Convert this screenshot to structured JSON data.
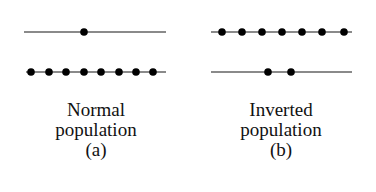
{
  "panels": [
    {
      "id": "a",
      "caption_line1": "Normal",
      "caption_line2": "population",
      "label": "(a)",
      "upper_level": {
        "y": 32,
        "x1": 24,
        "x2": 166,
        "dots": [
          84
        ]
      },
      "lower_level": {
        "y": 72,
        "x1": 26,
        "x2": 166,
        "dots": [
          31,
          49,
          66,
          84,
          101,
          119,
          136,
          153
        ]
      }
    },
    {
      "id": "b",
      "caption_line1": "Inverted",
      "caption_line2": "population",
      "label": "(b)",
      "upper_level": {
        "y": 32,
        "x1": 211,
        "x2": 352,
        "dots": [
          222,
          242,
          262,
          282,
          302,
          322,
          344
        ]
      },
      "lower_level": {
        "y": 72,
        "x1": 211,
        "x2": 352,
        "dots": [
          268,
          291
        ]
      }
    }
  ],
  "colors": {
    "line": "#8a8a8a",
    "dot": "#000000",
    "text": "#111111"
  }
}
